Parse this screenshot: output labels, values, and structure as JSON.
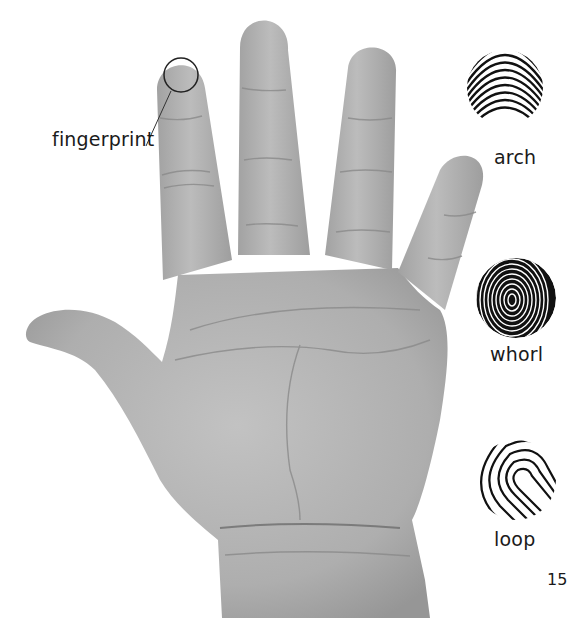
{
  "diagram": {
    "callout": {
      "label": "fingerprint",
      "target": "index-fingertip"
    },
    "fingerprint_types": [
      {
        "name": "arch"
      },
      {
        "name": "whorl"
      },
      {
        "name": "loop"
      }
    ],
    "page_number": "15",
    "colors": {
      "background": "#ffffff",
      "skin_light": "#b9b9b9",
      "skin_mid": "#a6a6a6",
      "skin_dark": "#8c8c8c",
      "ink": "#111111",
      "text": "#1a1a1a"
    }
  }
}
